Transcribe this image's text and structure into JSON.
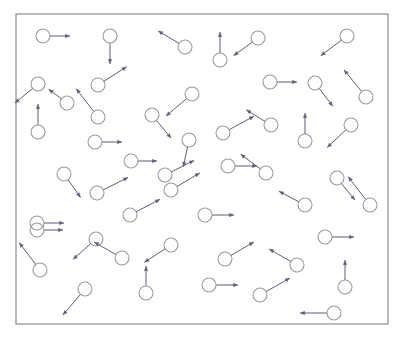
{
  "figure": {
    "title": "",
    "width": 402,
    "height": 339,
    "background_color": "#ffffff"
  },
  "box": {
    "x": 16,
    "y": 14,
    "width": 372,
    "height": 310,
    "stroke_color": "#8c8c8c",
    "stroke_width": 1.2,
    "fill_color": "#ffffff"
  },
  "style": {
    "particle_stroke": "#9a9a9a",
    "particle_fill": "none",
    "particle_radius": 7,
    "particle_stroke_width": 1.1,
    "arrow_color": "#5b5f78",
    "arrow_stroke_width": 1.0,
    "arrow_head_size": 4.5
  },
  "chart_data": {
    "type": "scatter",
    "title": "",
    "xlabel": "",
    "ylabel": "",
    "xlim": [
      16,
      388
    ],
    "ylim": [
      14,
      324
    ],
    "grid": false,
    "legend": null,
    "particle_count": 48,
    "particles": [
      {
        "id": 1,
        "x": 43,
        "y": 36,
        "vx": 19,
        "vy": 0
      },
      {
        "id": 2,
        "x": 110,
        "y": 36,
        "vx": 0,
        "vy": 20
      },
      {
        "id": 3,
        "x": 185,
        "y": 47,
        "vx": -20,
        "vy": -12
      },
      {
        "id": 4,
        "x": 220,
        "y": 60,
        "vx": 0,
        "vy": -20
      },
      {
        "id": 5,
        "x": 258,
        "y": 38,
        "vx": -18,
        "vy": 13
      },
      {
        "id": 6,
        "x": 347,
        "y": 36,
        "vx": -20,
        "vy": 15
      },
      {
        "id": 7,
        "x": 38,
        "y": 84,
        "vx": -17,
        "vy": 14
      },
      {
        "id": 8,
        "x": 67,
        "y": 103,
        "vx": -12,
        "vy": -9
      },
      {
        "id": 9,
        "x": 98,
        "y": 117,
        "vx": -17,
        "vy": -22
      },
      {
        "id": 10,
        "x": 98,
        "y": 85,
        "vx": 22,
        "vy": -14
      },
      {
        "id": 11,
        "x": 38,
        "y": 132,
        "vx": 0,
        "vy": -20
      },
      {
        "id": 12,
        "x": 95,
        "y": 142,
        "vx": 19,
        "vy": 0
      },
      {
        "id": 13,
        "x": 192,
        "y": 94,
        "vx": -20,
        "vy": 17
      },
      {
        "id": 14,
        "x": 152,
        "y": 115,
        "vx": 14,
        "vy": 17
      },
      {
        "id": 15,
        "x": 189,
        "y": 140,
        "vx": -4,
        "vy": 19
      },
      {
        "id": 16,
        "x": 223,
        "y": 133,
        "vx": 24,
        "vy": -13
      },
      {
        "id": 17,
        "x": 270,
        "y": 82,
        "vx": 19,
        "vy": 0
      },
      {
        "id": 18,
        "x": 315,
        "y": 83,
        "vx": 13,
        "vy": 17
      },
      {
        "id": 19,
        "x": 366,
        "y": 97,
        "vx": -17,
        "vy": -21
      },
      {
        "id": 20,
        "x": 271,
        "y": 125,
        "vx": -18,
        "vy": -11
      },
      {
        "id": 21,
        "x": 305,
        "y": 141,
        "vx": 0,
        "vy": -20
      },
      {
        "id": 22,
        "x": 351,
        "y": 125,
        "vx": -18,
        "vy": 17
      },
      {
        "id": 23,
        "x": 131,
        "y": 161,
        "vx": 18,
        "vy": 0
      },
      {
        "id": 24,
        "x": 64,
        "y": 174,
        "vx": 12,
        "vy": 17
      },
      {
        "id": 25,
        "x": 97,
        "y": 193,
        "vx": 24,
        "vy": -12
      },
      {
        "id": 26,
        "x": 171,
        "y": 190,
        "vx": 22,
        "vy": -13
      },
      {
        "id": 27,
        "x": 130,
        "y": 215,
        "vx": 23,
        "vy": -12
      },
      {
        "id": 28,
        "x": 37,
        "y": 223,
        "vx": 19,
        "vy": 0
      },
      {
        "id": 29,
        "x": 165,
        "y": 175,
        "vx": 22,
        "vy": -11
      },
      {
        "id": 30,
        "x": 228,
        "y": 166,
        "vx": 21,
        "vy": 0
      },
      {
        "id": 31,
        "x": 205,
        "y": 215,
        "vx": 21,
        "vy": 0
      },
      {
        "id": 32,
        "x": 266,
        "y": 173,
        "vx": -19,
        "vy": -14
      },
      {
        "id": 33,
        "x": 337,
        "y": 178,
        "vx": 13,
        "vy": 16
      },
      {
        "id": 34,
        "x": 370,
        "y": 205,
        "vx": -17,
        "vy": -22
      },
      {
        "id": 35,
        "x": 305,
        "y": 205,
        "vx": -19,
        "vy": -10
      },
      {
        "id": 36,
        "x": 37,
        "y": 230,
        "vx": 18,
        "vy": 0
      },
      {
        "id": 37,
        "x": 96,
        "y": 239,
        "vx": -17,
        "vy": 15
      },
      {
        "id": 38,
        "x": 122,
        "y": 258,
        "vx": -21,
        "vy": -12
      },
      {
        "id": 39,
        "x": 40,
        "y": 270,
        "vx": -16,
        "vy": -21
      },
      {
        "id": 40,
        "x": 85,
        "y": 289,
        "vx": -17,
        "vy": 20
      },
      {
        "id": 41,
        "x": 146,
        "y": 293,
        "vx": 0,
        "vy": -19
      },
      {
        "id": 42,
        "x": 171,
        "y": 245,
        "vx": -20,
        "vy": 13
      },
      {
        "id": 43,
        "x": 325,
        "y": 237,
        "vx": 21,
        "vy": 0
      },
      {
        "id": 44,
        "x": 225,
        "y": 259,
        "vx": 22,
        "vy": -13
      },
      {
        "id": 45,
        "x": 297,
        "y": 265,
        "vx": -21,
        "vy": -12
      },
      {
        "id": 46,
        "x": 209,
        "y": 285,
        "vx": 21,
        "vy": 0
      },
      {
        "id": 47,
        "x": 260,
        "y": 295,
        "vx": 23,
        "vy": -13
      },
      {
        "id": 48,
        "x": 345,
        "y": 287,
        "vx": 0,
        "vy": -19
      },
      {
        "id": 49,
        "x": 334,
        "y": 313,
        "vx": -26,
        "vy": 0
      }
    ]
  }
}
